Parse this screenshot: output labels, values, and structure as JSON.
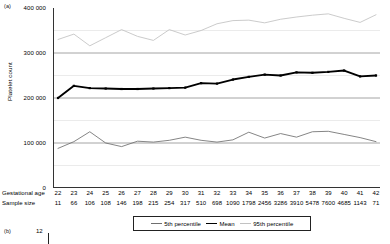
{
  "figure": {
    "panel_a_tag": "(a)",
    "panel_b_tag": "(b)",
    "panel_b_first_ytick": "12"
  },
  "axes": {
    "y_title": "Platelet count",
    "y_ticks": [
      "0",
      "100 000",
      "200 000",
      "300 000",
      "400 000"
    ],
    "x_row_age_title": "Gestational age",
    "x_row_n_title": "Sample size"
  },
  "legend": {
    "items": [
      {
        "label": "5th percentile",
        "color": "#6f6f6f"
      },
      {
        "label": "Mean",
        "color": "#000000"
      },
      {
        "label": "95th percentile",
        "color": "#c2c2c2"
      }
    ]
  },
  "chart_data": {
    "type": "line",
    "title": "",
    "xlabel": "Gestational age",
    "ylabel": "Platelet count",
    "ylim": [
      0,
      400000
    ],
    "ytick_values": [
      0,
      100000,
      200000,
      300000,
      400000
    ],
    "minor_gridlines": [
      50000,
      150000,
      250000,
      350000
    ],
    "grid": true,
    "legend_position": "bottom",
    "categories": [
      22,
      23,
      24,
      25,
      26,
      27,
      28,
      29,
      30,
      31,
      32,
      33,
      34,
      35,
      36,
      37,
      38,
      39,
      40,
      41,
      42
    ],
    "sample_size": [
      11,
      66,
      106,
      108,
      146,
      198,
      215,
      254,
      317,
      510,
      698,
      1090,
      1798,
      2456,
      3286,
      3910,
      5478,
      7600,
      4685,
      1143,
      71
    ],
    "series": [
      {
        "name": "5th percentile",
        "color": "#6f6f6f",
        "values": [
          88000,
          103000,
          125000,
          100000,
          92000,
          104000,
          102000,
          106000,
          113000,
          106000,
          102000,
          107000,
          124000,
          111000,
          121000,
          113000,
          125000,
          126000,
          119000,
          112000,
          103000
        ]
      },
      {
        "name": "Mean",
        "color": "#000000",
        "values": [
          200000,
          227000,
          222000,
          221000,
          220000,
          220000,
          221000,
          222000,
          223000,
          233000,
          232000,
          241000,
          247000,
          252000,
          250000,
          257000,
          256000,
          258000,
          261000,
          248000,
          250000
        ]
      },
      {
        "name": "95th percentile",
        "color": "#c2c2c2",
        "values": [
          330000,
          342000,
          316000,
          334000,
          352000,
          337000,
          328000,
          352000,
          340000,
          350000,
          365000,
          372000,
          373000,
          367000,
          375000,
          380000,
          384000,
          387000,
          377000,
          368000,
          385000
        ]
      }
    ]
  }
}
